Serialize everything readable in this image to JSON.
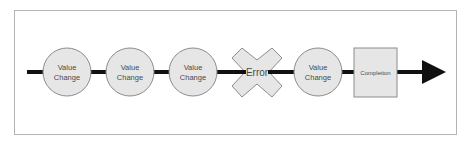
{
  "diagram": {
    "type": "process-flow",
    "direction": "left-to-right",
    "colors": {
      "frame_border": "#b4b4b4",
      "line": "#111111",
      "node_fill": "#e6e6e6",
      "node_stroke": "#8c8c8c",
      "text": "#4a4a4a"
    },
    "nodes": [
      {
        "id": "n1",
        "shape": "circle",
        "line1": "Value",
        "line2": "Change"
      },
      {
        "id": "n2",
        "shape": "circle",
        "line1": "Value",
        "line2": "Change"
      },
      {
        "id": "n3",
        "shape": "circle",
        "line1": "Value",
        "line2": "Change"
      },
      {
        "id": "n4",
        "shape": "x-cross",
        "label": "Error"
      },
      {
        "id": "n5",
        "shape": "circle",
        "line1": "Value",
        "line2": "Change"
      },
      {
        "id": "n6",
        "shape": "square",
        "label": "Completion"
      }
    ],
    "arrow": {
      "end": "right"
    }
  }
}
